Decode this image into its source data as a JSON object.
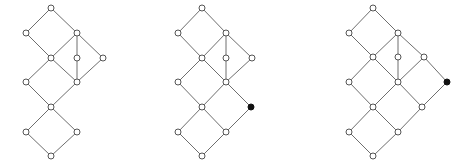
{
  "diagrams": [
    {
      "id": "lattice-1",
      "nodes": [
        {
          "x": 51,
          "y": 8,
          "filled": false
        },
        {
          "x": 26,
          "y": 33,
          "filled": false
        },
        {
          "x": 77,
          "y": 33,
          "filled": false
        },
        {
          "x": 51,
          "y": 58,
          "filled": false
        },
        {
          "x": 77,
          "y": 58,
          "filled": false
        },
        {
          "x": 103,
          "y": 58,
          "filled": false
        },
        {
          "x": 26,
          "y": 82,
          "filled": false
        },
        {
          "x": 77,
          "y": 82,
          "filled": false
        },
        {
          "x": 51,
          "y": 107,
          "filled": false
        },
        {
          "x": 26,
          "y": 132,
          "filled": false
        },
        {
          "x": 77,
          "y": 132,
          "filled": false
        },
        {
          "x": 51,
          "y": 156,
          "filled": false
        }
      ],
      "edges": [
        [
          0,
          1
        ],
        [
          0,
          2
        ],
        [
          1,
          3
        ],
        [
          2,
          3
        ],
        [
          2,
          4
        ],
        [
          2,
          5
        ],
        [
          3,
          6
        ],
        [
          3,
          7
        ],
        [
          4,
          7
        ],
        [
          5,
          7
        ],
        [
          6,
          8
        ],
        [
          7,
          8
        ],
        [
          8,
          9
        ],
        [
          8,
          10
        ],
        [
          9,
          11
        ],
        [
          10,
          11
        ]
      ]
    },
    {
      "id": "lattice-2",
      "nodes": [
        {
          "x": 202,
          "y": 8,
          "filled": false
        },
        {
          "x": 178,
          "y": 33,
          "filled": false
        },
        {
          "x": 226,
          "y": 33,
          "filled": false
        },
        {
          "x": 202,
          "y": 58,
          "filled": false
        },
        {
          "x": 226,
          "y": 58,
          "filled": false
        },
        {
          "x": 252,
          "y": 58,
          "filled": false
        },
        {
          "x": 178,
          "y": 82,
          "filled": false
        },
        {
          "x": 226,
          "y": 82,
          "filled": false
        },
        {
          "x": 202,
          "y": 107,
          "filled": false
        },
        {
          "x": 251,
          "y": 107,
          "filled": true
        },
        {
          "x": 178,
          "y": 132,
          "filled": false
        },
        {
          "x": 226,
          "y": 132,
          "filled": false
        },
        {
          "x": 202,
          "y": 156,
          "filled": false
        }
      ],
      "edges": [
        [
          0,
          1
        ],
        [
          0,
          2
        ],
        [
          1,
          3
        ],
        [
          2,
          3
        ],
        [
          2,
          4
        ],
        [
          2,
          5
        ],
        [
          3,
          6
        ],
        [
          3,
          7
        ],
        [
          4,
          7
        ],
        [
          5,
          7
        ],
        [
          6,
          8
        ],
        [
          7,
          8
        ],
        [
          7,
          9
        ],
        [
          8,
          10
        ],
        [
          8,
          11
        ],
        [
          9,
          11
        ],
        [
          10,
          12
        ],
        [
          11,
          12
        ]
      ]
    },
    {
      "id": "lattice-3",
      "nodes": [
        {
          "x": 373,
          "y": 8,
          "filled": false
        },
        {
          "x": 349,
          "y": 33,
          "filled": false
        },
        {
          "x": 398,
          "y": 33,
          "filled": false
        },
        {
          "x": 373,
          "y": 57,
          "filled": false
        },
        {
          "x": 398,
          "y": 57,
          "filled": false
        },
        {
          "x": 424,
          "y": 57,
          "filled": false
        },
        {
          "x": 349,
          "y": 82,
          "filled": false
        },
        {
          "x": 398,
          "y": 82,
          "filled": false
        },
        {
          "x": 447,
          "y": 82,
          "filled": true
        },
        {
          "x": 373,
          "y": 107,
          "filled": false
        },
        {
          "x": 422,
          "y": 107,
          "filled": false
        },
        {
          "x": 349,
          "y": 132,
          "filled": false
        },
        {
          "x": 398,
          "y": 132,
          "filled": false
        },
        {
          "x": 373,
          "y": 156,
          "filled": false
        }
      ],
      "edges": [
        [
          0,
          1
        ],
        [
          0,
          2
        ],
        [
          1,
          3
        ],
        [
          2,
          3
        ],
        [
          2,
          4
        ],
        [
          2,
          5
        ],
        [
          3,
          6
        ],
        [
          3,
          7
        ],
        [
          4,
          7
        ],
        [
          5,
          7
        ],
        [
          5,
          8
        ],
        [
          6,
          9
        ],
        [
          7,
          9
        ],
        [
          7,
          10
        ],
        [
          8,
          10
        ],
        [
          9,
          11
        ],
        [
          9,
          12
        ],
        [
          10,
          12
        ],
        [
          11,
          13
        ],
        [
          12,
          13
        ]
      ]
    }
  ],
  "style": {
    "edge_color": "#6e6e6e",
    "node_stroke": "#555555",
    "node_fill": "#ffffff",
    "filled_node_color": "#111111",
    "node_radius": 3
  }
}
